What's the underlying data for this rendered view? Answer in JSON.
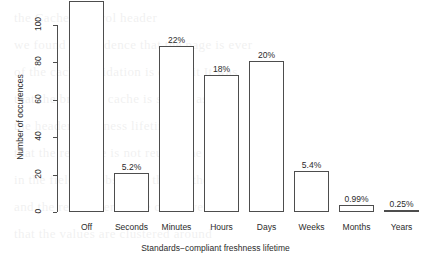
{
  "chart_data": {
    "type": "bar",
    "title": "",
    "xlabel": "Standards−compliant freshness lifetime",
    "ylabel": "Number of occurences",
    "categories": [
      "Off",
      "Seconds",
      "Minutes",
      "Hours",
      "Days",
      "Weeks",
      "Months",
      "Years"
    ],
    "values": [
      113,
      21,
      89,
      73,
      81,
      22,
      4,
      1
    ],
    "data_labels": [
      "28%",
      "5.2%",
      "22%",
      "18%",
      "20%",
      "5.4%",
      "0.99%",
      "0.25%"
    ],
    "ylim": [
      0,
      113
    ],
    "yticks": [
      0,
      20,
      40,
      60,
      80,
      100
    ],
    "ytick_labels": [
      "0",
      "20",
      "40",
      "60",
      "80",
      "100"
    ],
    "grid": false,
    "legend": null,
    "bar_fill_color": "#ffffff",
    "bar_edge_color": "#4d4d4d",
    "axis_color": "#4d4d4d",
    "text_color": "#2b2b2b",
    "background_color": "#ffffff"
  },
  "bleed_text": [
    "the Cache-Control header",
    "we found no evidence that the page is ever",
    "of the cache validation is explicit  It was",
    "that the browser cache is served as a",
    "",
    "the  header    freshness lifetime",
    "",
    "that the resource is not reused  the",
    "in the field  we observed that    of the",
    "and the remainder of the cases were",
    "",
    "that the values are clustered around"
  ]
}
